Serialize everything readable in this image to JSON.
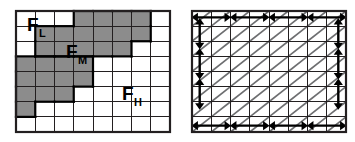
{
  "figure": {
    "title": "",
    "panel_count": 2,
    "background_color": "#ffffff",
    "line_color": "#231f20",
    "shade_color": "#8c8c8c",
    "outline_color": "#000000"
  },
  "left_panel": {
    "name": "frequency-band-grid",
    "geometry": {
      "x": 16,
      "y": 11,
      "width": 154,
      "height": 121,
      "cols": 8,
      "rows": 8
    },
    "border_width": 2.2,
    "grid_line_width": 1.0,
    "shaded_cells": [
      [
        3,
        0
      ],
      [
        4,
        0
      ],
      [
        5,
        0
      ],
      [
        6,
        0
      ],
      [
        1,
        1
      ],
      [
        2,
        1
      ],
      [
        3,
        1
      ],
      [
        4,
        1
      ],
      [
        5,
        1
      ],
      [
        6,
        1
      ],
      [
        1,
        2
      ],
      [
        2,
        2
      ],
      [
        3,
        2
      ],
      [
        4,
        2
      ],
      [
        5,
        2
      ],
      [
        0,
        3
      ],
      [
        1,
        3
      ],
      [
        2,
        3
      ],
      [
        3,
        3
      ],
      [
        0,
        4
      ],
      [
        1,
        4
      ],
      [
        2,
        4
      ],
      [
        3,
        4
      ],
      [
        0,
        5
      ],
      [
        1,
        5
      ],
      [
        2,
        5
      ],
      [
        0,
        6
      ]
    ],
    "outlines": [
      {
        "name": "FL-region",
        "cells": [
          [
            3,
            0
          ],
          [
            4,
            0
          ],
          [
            5,
            0
          ],
          [
            6,
            0
          ],
          [
            1,
            1
          ],
          [
            2,
            1
          ],
          [
            3,
            1
          ],
          [
            4,
            1
          ],
          [
            5,
            1
          ],
          [
            6,
            1
          ],
          [
            1,
            2
          ],
          [
            2,
            2
          ],
          [
            3,
            2
          ],
          [
            4,
            2
          ],
          [
            5,
            2
          ]
        ]
      },
      {
        "name": "FM-region",
        "cells": [
          [
            0,
            3
          ],
          [
            1,
            3
          ],
          [
            2,
            3
          ],
          [
            3,
            3
          ],
          [
            0,
            4
          ],
          [
            1,
            4
          ],
          [
            2,
            4
          ],
          [
            3,
            4
          ],
          [
            0,
            5
          ],
          [
            1,
            5
          ],
          [
            2,
            5
          ],
          [
            0,
            6
          ]
        ]
      }
    ],
    "labels": [
      {
        "name": "label-FL",
        "base": "F",
        "sub": "L",
        "x": 27,
        "y": 16
      },
      {
        "name": "label-FM",
        "base": "F",
        "sub": "M",
        "x": 66,
        "y": 43
      },
      {
        "name": "label-FH",
        "base": "F",
        "sub": "H",
        "x": 122,
        "y": 85
      }
    ]
  },
  "right_panel": {
    "name": "diagonal-flow-grid",
    "geometry": {
      "x": 192,
      "y": 11,
      "width": 154,
      "height": 121,
      "cols": 8,
      "rows": 8
    },
    "border_width": 2.2,
    "grid_line_width": 1.0,
    "diagonal_color": "#6d6e70",
    "diagonal_line_width": 1.6,
    "diagonal_direction": "bottom-left-to-top-right",
    "arrows": {
      "color": "#000000",
      "top_edge": {
        "name": "top-horizontal-arrows",
        "type": "double-headed-horizontal",
        "count": 4,
        "columns": [
          0,
          2,
          4,
          6
        ]
      },
      "bottom_edge": {
        "name": "bottom-horizontal-arrows",
        "type": "double-headed-horizontal",
        "count": 4,
        "columns": [
          0,
          2,
          4,
          6
        ]
      },
      "left_edge": {
        "name": "left-vertical-arrows",
        "type": "double-headed-vertical",
        "count": 3,
        "rows": [
          1,
          3,
          5
        ]
      },
      "right_edge": {
        "name": "right-vertical-arrows",
        "type": "double-headed-vertical",
        "count": 3,
        "rows": [
          1,
          3,
          5
        ]
      }
    }
  }
}
